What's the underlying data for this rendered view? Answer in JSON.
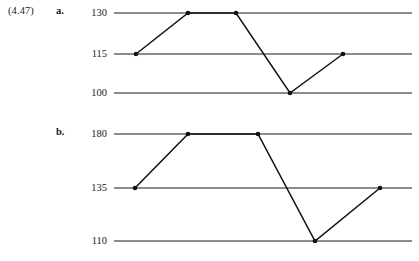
{
  "figure": {
    "exercise_number": "(4.47)",
    "part_a_label": "a.",
    "part_b_label": "b.",
    "line_color": "#111111",
    "gridline_color": "#8c8c8c",
    "background_color": "#ffffff"
  },
  "chart_data": [
    {
      "id": "chart-a",
      "type": "line",
      "title": "",
      "xlabel": "",
      "ylabel": "",
      "grid": true,
      "legend": false,
      "x": [
        1,
        2,
        3,
        4,
        5
      ],
      "values": [
        115,
        130,
        130,
        100,
        115
      ],
      "ytick_labels": [
        "130",
        "115",
        "100"
      ],
      "yticks": [
        130,
        115,
        100
      ],
      "ylim": [
        100,
        130
      ],
      "marker": "filled-circle",
      "point_labels": [
        "115",
        "130",
        "130",
        "100",
        "115"
      ]
    },
    {
      "id": "chart-b",
      "type": "line",
      "title": "",
      "xlabel": "",
      "ylabel": "",
      "grid": true,
      "legend": false,
      "x": [
        1,
        2,
        3,
        4,
        5
      ],
      "values": [
        135,
        180,
        180,
        110,
        135
      ],
      "ytick_labels": [
        "180",
        "135",
        "110"
      ],
      "yticks": [
        180,
        135,
        110
      ],
      "ylim": [
        110,
        180
      ],
      "marker": "filled-circle",
      "point_labels": [
        "135",
        "180",
        "180",
        "110",
        "135"
      ]
    }
  ],
  "geometry": {
    "chart_a": {
      "gridline_y": [
        13,
        54,
        93
      ],
      "grid_x_start": 114,
      "grid_x_end": 412,
      "label_x": 107,
      "point_x": [
        136,
        188,
        236,
        290,
        343
      ],
      "point_y": [
        54,
        13,
        13,
        93,
        54
      ]
    },
    "chart_b": {
      "gridline_y": [
        134,
        188,
        241
      ],
      "grid_x_start": 114,
      "grid_x_end": 412,
      "label_x": 107,
      "point_x": [
        135,
        188,
        258,
        315,
        380
      ],
      "point_y": [
        188,
        134,
        134,
        241,
        188
      ]
    }
  }
}
